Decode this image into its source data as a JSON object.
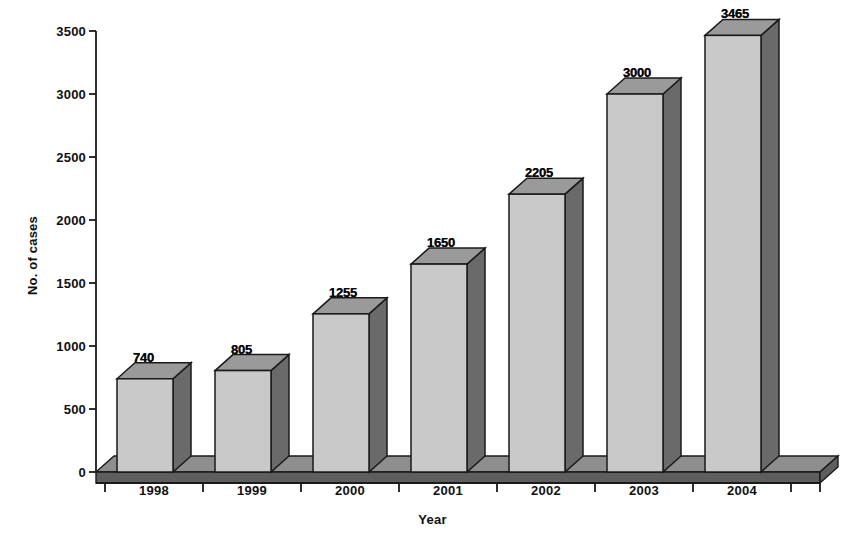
{
  "chart_data": {
    "type": "bar",
    "title": "",
    "subtitle": "",
    "xlabel": "Year",
    "ylabel": "No. of cases",
    "categories": [
      "1998",
      "1999",
      "2000",
      "2001",
      "2002",
      "2003",
      "2004"
    ],
    "values": [
      740,
      805,
      1255,
      1650,
      2205,
      3000,
      3465
    ],
    "data_labels": [
      "740",
      "805",
      "1255",
      "1650",
      "2205",
      "3000",
      "3465"
    ],
    "series": [
      {
        "name": "No. of cases",
        "values": [
          740,
          805,
          1255,
          1650,
          2205,
          3000,
          3465
        ]
      }
    ],
    "ylim": [
      0,
      3500
    ],
    "ytick_values": [
      0,
      500,
      1000,
      1500,
      2000,
      2500,
      3000,
      3500
    ],
    "ytick_labels": [
      "0",
      "500",
      "1000",
      "1500",
      "2000",
      "2500",
      "3000",
      "3500"
    ],
    "xtick_labels": [
      "1998",
      "1999",
      "2000",
      "2001",
      "2002",
      "2003",
      "2004"
    ],
    "grid": false,
    "legend": null,
    "legend_position": "none",
    "style": "3d-column",
    "colors": {
      "bar_front": "#c9c9c9",
      "bar_side": "#6a6a6a",
      "bar_top": "#9a9a9a",
      "floor_top": "#8e8e8e",
      "floor_front": "#5e5e5e",
      "outline": "#1a1a1a",
      "axis": "#1a1a1a",
      "text": "#101010",
      "background": "#ffffff"
    }
  }
}
